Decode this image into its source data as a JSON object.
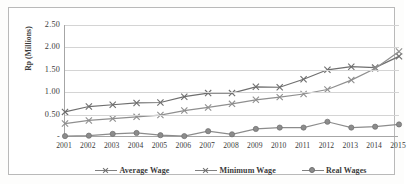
{
  "chart_data": {
    "type": "line",
    "title": "",
    "xlabel": "",
    "ylabel": "Rp (Millions)",
    "ylim": [
      0,
      2.5
    ],
    "ytick_labels": [
      "2.50",
      "2.00",
      "1.50",
      "1.00",
      "0.50",
      "-"
    ],
    "ytick_values": [
      2.5,
      2.0,
      1.5,
      1.0,
      0.5,
      0.0
    ],
    "grid": true,
    "legend_position": "bottom",
    "categories": [
      "2001",
      "2002",
      "2003",
      "2004",
      "2005",
      "2006",
      "2007",
      "2008",
      "2009",
      "2010",
      "2011",
      "2012",
      "2013",
      "2014",
      "2015"
    ],
    "series": [
      {
        "name": "Average Wage",
        "marker": "x",
        "color": "#6e6e6e",
        "values": [
          0.56,
          0.68,
          0.72,
          0.76,
          0.77,
          0.9,
          0.98,
          0.98,
          1.12,
          1.11,
          1.29,
          1.5,
          1.57,
          1.55,
          1.8
        ]
      },
      {
        "name": "Minimum Wage",
        "marker": "x",
        "color": "#8f8f8f",
        "values": [
          0.3,
          0.37,
          0.41,
          0.45,
          0.49,
          0.59,
          0.66,
          0.74,
          0.83,
          0.89,
          0.96,
          1.06,
          1.27,
          1.53,
          1.91
        ]
      },
      {
        "name": "Real Wages",
        "marker": "circle",
        "color": "#8c8c8c",
        "values": [
          0.02,
          0.03,
          0.07,
          0.09,
          0.04,
          0.02,
          0.13,
          0.06,
          0.18,
          0.21,
          0.21,
          0.34,
          0.21,
          0.23,
          0.28
        ]
      }
    ]
  },
  "legend": {
    "items": [
      {
        "label": "Average Wage"
      },
      {
        "label": "Minimum Wage"
      },
      {
        "label": "Real Wages"
      }
    ]
  }
}
